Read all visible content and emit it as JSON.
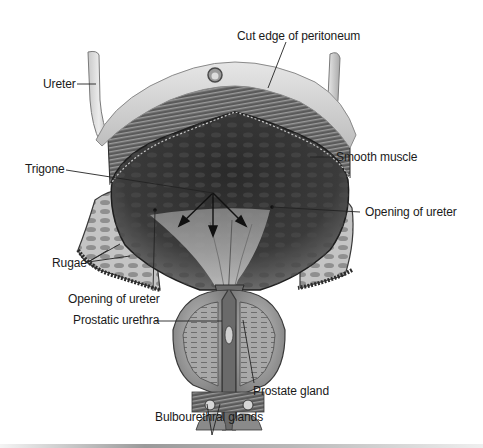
{
  "figure": {
    "colors": {
      "background": "#ffffff",
      "peritoneum": "#d9d9d9",
      "muscle_dark": "#2e2e2e",
      "interior": "#3a3a3a",
      "mucosa_light": "#bdbdbd",
      "rugae_pattern": "#8a8a8a",
      "label_text": "#1a1a1a"
    }
  },
  "labels": {
    "cut_edge": "Cut edge of peritoneum",
    "ureter": "Ureter",
    "smooth_muscle": "Smooth muscle",
    "trigone": "Trigone",
    "opening_ureter_right": "Opening of ureter",
    "rugae": "Rugae",
    "opening_ureter_left": "Opening of ureter",
    "prostatic_urethra": "Prostatic urethra",
    "prostate_gland": "Prostate gland",
    "bulbourethral_glands": "Bulbourethral glands"
  }
}
